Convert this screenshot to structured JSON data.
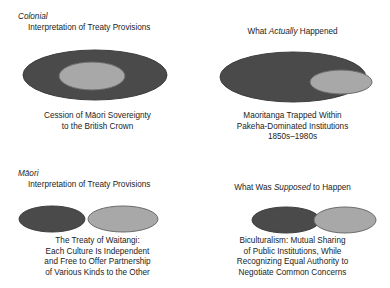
{
  "figure": {
    "colors": {
      "dark": "#4a4a4a",
      "light": "#a8a8a8",
      "outline": "#3d3d3d",
      "text": "#1c1c1c",
      "background": "#ffffff"
    },
    "panels": [
      {
        "id": "colonial-interpretation",
        "heading_line1_italic": "Colonial",
        "heading_line2": "Interpretation of Treaty Provisions",
        "caption_lines": [
          "Cession of Māori Sovereignty",
          "to the British Crown"
        ],
        "diagram": {
          "type": "nested-ellipses",
          "description": "small light ellipse fully inside large dark ellipse",
          "shapes": [
            {
              "name": "outer-dark-ellipse",
              "fill": "dark",
              "cx": 95,
              "cy": 75,
              "rx": 72,
              "ry": 25
            },
            {
              "name": "inner-light-ellipse",
              "fill": "light",
              "cx": 92,
              "cy": 76,
              "rx": 33,
              "ry": 14
            }
          ]
        }
      },
      {
        "id": "what-actually-happened",
        "heading_plain_before": "What ",
        "heading_italic": "Actually",
        "heading_plain_after": " Happened",
        "caption_lines": [
          "Maoritanga Trapped Within",
          "Pakeha-Dominated Institutions",
          "1850s–1980s"
        ],
        "diagram": {
          "type": "nested-ellipses-offset",
          "description": "light ellipse inside dark ellipse, pushed to the right edge",
          "shapes": [
            {
              "name": "outer-dark-ellipse",
              "fill": "dark",
              "cx": 98,
              "cy": 77,
              "rx": 73,
              "ry": 25
            },
            {
              "name": "inner-light-ellipse",
              "fill": "light",
              "cx": 146,
              "cy": 82,
              "rx": 31,
              "ry": 12
            }
          ]
        }
      },
      {
        "id": "maori-interpretation",
        "heading_line1_italic": "Māori",
        "heading_line2": "Interpretation of Treaty Provisions",
        "caption_lines": [
          "The Treaty of Waitangi:",
          "Each Culture Is Independent",
          "and Free to Offer Partnership",
          "of Various Kinds to the Other"
        ],
        "diagram": {
          "type": "separate-ellipses",
          "description": "two non-touching ellipses side by side",
          "shapes": [
            {
              "name": "left-dark-ellipse",
              "fill": "dark",
              "cx": 52,
              "cy": 69,
              "rx": 33,
              "ry": 13
            },
            {
              "name": "right-light-ellipse",
              "fill": "light",
              "cx": 123,
              "cy": 69,
              "rx": 35,
              "ry": 13
            }
          ]
        }
      },
      {
        "id": "what-was-supposed-to-happen",
        "heading_plain_before": "What Was ",
        "heading_italic": "Supposed",
        "heading_plain_after": " to Happen",
        "caption_lines": [
          "Biculturalism: Mutual Sharing",
          "of Public Institutions, While",
          "Recognizing Equal Authority to",
          "Negotiate Common Concerns"
        ],
        "diagram": {
          "type": "overlapping-ellipses",
          "description": "two partially overlapping ellipses, light one drawn on top",
          "shapes": [
            {
              "name": "left-dark-ellipse",
              "fill": "dark",
              "cx": 91,
              "cy": 70,
              "rx": 34,
              "ry": 13
            },
            {
              "name": "right-light-ellipse",
              "fill": "light",
              "cx": 150,
              "cy": 70,
              "rx": 31,
              "ry": 13
            }
          ]
        }
      }
    ]
  }
}
